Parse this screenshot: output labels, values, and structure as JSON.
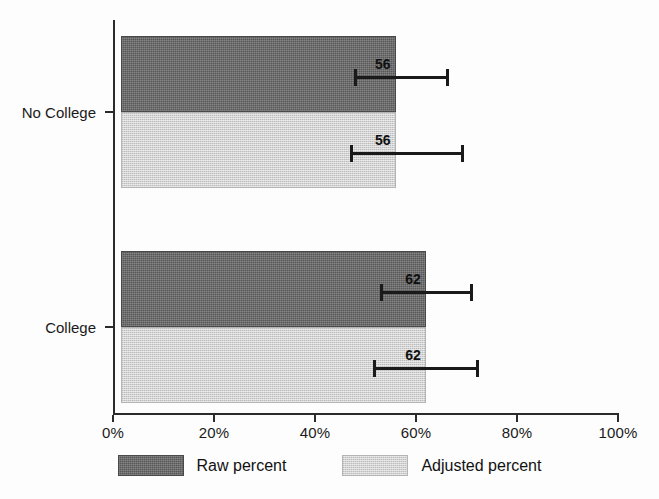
{
  "chart_data": {
    "type": "bar",
    "orientation": "horizontal",
    "title": "",
    "xlabel": "",
    "ylabel": "",
    "xlim": [
      0,
      100
    ],
    "xticks": [
      0,
      20,
      40,
      60,
      80,
      100
    ],
    "xtick_labels": [
      "0%",
      "20%",
      "40%",
      "60%",
      "80%",
      "100%"
    ],
    "categories": [
      "No College",
      "College"
    ],
    "grid": false,
    "legend_position": "bottom",
    "series": [
      {
        "name": "Raw percent",
        "color": "#575757",
        "values": [
          56,
          62
        ],
        "labels": [
          "56",
          "62"
        ],
        "error_low": [
          47.7,
          52.9
        ],
        "error_high": [
          66.3,
          71.1
        ]
      },
      {
        "name": "Adjusted percent",
        "color": "#d2d2d2",
        "values": [
          56,
          62
        ],
        "labels": [
          "56",
          "62"
        ],
        "error_low": [
          46.9,
          51.5
        ],
        "error_high": [
          69.3,
          72.3
        ]
      }
    ]
  },
  "axes": {
    "x": {
      "ticks": [
        {
          "value": 0,
          "label": "0%"
        },
        {
          "value": 20,
          "label": "20%"
        },
        {
          "value": 40,
          "label": "40%"
        },
        {
          "value": 60,
          "label": "60%"
        },
        {
          "value": 80,
          "label": "80%"
        },
        {
          "value": 100,
          "label": "100%"
        }
      ]
    },
    "y": {
      "ticks": [
        {
          "label": "No College"
        },
        {
          "label": "College"
        }
      ]
    }
  },
  "legend": {
    "items": [
      {
        "label": "Raw percent",
        "swatch": "raw"
      },
      {
        "label": "Adjusted percent",
        "swatch": "adjusted"
      }
    ]
  },
  "bars": [
    {
      "group": "No College",
      "series": "Raw percent",
      "value_label": "56"
    },
    {
      "group": "No College",
      "series": "Adjusted percent",
      "value_label": "56"
    },
    {
      "group": "College",
      "series": "Raw percent",
      "value_label": "62"
    },
    {
      "group": "College",
      "series": "Adjusted percent",
      "value_label": "62"
    }
  ]
}
